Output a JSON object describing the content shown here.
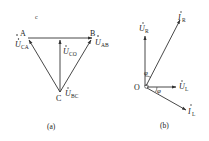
{
  "figure_a": {
    "caption": "(a)",
    "corner_label": "c",
    "vertices": {
      "A": "A",
      "B": "B",
      "C": "C"
    },
    "phasors": [
      {
        "symbol": "U",
        "sub": "CA"
      },
      {
        "symbol": "U",
        "sub": "AB"
      },
      {
        "symbol": "U",
        "sub": "CO"
      },
      {
        "symbol": "U",
        "sub": "BC"
      }
    ]
  },
  "figure_b": {
    "caption": "(b)",
    "origin": "O",
    "angle": "φ",
    "phasors": [
      {
        "symbol": "U",
        "sub": "R"
      },
      {
        "symbol": "I",
        "sub": "R"
      },
      {
        "symbol": "U",
        "sub": "L"
      },
      {
        "symbol": "I",
        "sub": "L"
      }
    ]
  },
  "colors": {
    "line": "#333333",
    "text": "#222222"
  }
}
